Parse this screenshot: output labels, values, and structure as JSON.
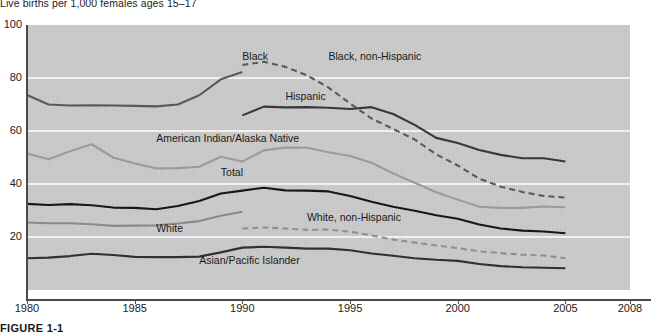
{
  "figure": {
    "subtitle": "Live births per 1,000 females ages 15–17",
    "caption": "FIGURE 1-1"
  },
  "chart_data": {
    "type": "line",
    "title": "",
    "subtitle": "Live births per 1,000 females ages 15–17",
    "xlabel": "",
    "ylabel": "Live births per 1,000 females ages 15–17",
    "xlim": [
      1980,
      2008
    ],
    "ylim": [
      0,
      100
    ],
    "xticks": [
      1980,
      1985,
      1990,
      1995,
      2000,
      2005,
      2008
    ],
    "yticks": [
      20,
      40,
      60,
      80,
      100
    ],
    "grid": "horizontal",
    "legend": "inline-labels",
    "series": [
      {
        "name": "Black",
        "style": "solid",
        "color": "#555555",
        "label_x": 1990,
        "label_y": 88,
        "x": [
          1980,
          1981,
          1982,
          1983,
          1984,
          1985,
          1986,
          1987,
          1988,
          1989,
          1990
        ],
        "values": [
          73.6,
          70.0,
          69.6,
          69.7,
          69.6,
          69.5,
          69.3,
          70.0,
          73.5,
          79.5,
          82.3
        ]
      },
      {
        "name": "Black, non-Hispanic",
        "style": "dashed",
        "color": "#555555",
        "label_x": 1994,
        "label_y": 88,
        "x": [
          1990,
          1991,
          1992,
          1993,
          1994,
          1995,
          1996,
          1997,
          1998,
          1999,
          2000,
          2001,
          2002,
          2003,
          2004,
          2005
        ],
        "values": [
          84.9,
          86.1,
          84.2,
          81.0,
          76.4,
          70.4,
          64.7,
          60.8,
          56.8,
          51.2,
          47.0,
          42.0,
          39.0,
          37.0,
          35.5,
          34.9
        ]
      },
      {
        "name": "Hispanic",
        "style": "solid",
        "color": "#333333",
        "label_x": 1992,
        "label_y": 73,
        "x": [
          1990,
          1991,
          1992,
          1993,
          1994,
          1995,
          1996,
          1997,
          1998,
          1999,
          2000,
          2001,
          2002,
          2003,
          2004,
          2005
        ],
        "values": [
          65.9,
          69.2,
          68.9,
          69.0,
          68.8,
          68.3,
          69.0,
          66.4,
          62.3,
          57.4,
          55.5,
          52.8,
          51.0,
          49.7,
          49.7,
          48.5
        ]
      },
      {
        "name": "American Indian/Alaska Native",
        "style": "solid",
        "color": "#9a9a9a",
        "label_x": 1986,
        "label_y": 57,
        "x": [
          1980,
          1981,
          1982,
          1983,
          1984,
          1985,
          1986,
          1987,
          1988,
          1989,
          1990,
          1991,
          1992,
          1993,
          1994,
          1995,
          1996,
          1997,
          1998,
          1999,
          2000,
          2001,
          2002,
          2003,
          2004,
          2005
        ],
        "values": [
          51.5,
          49.3,
          52.4,
          55.0,
          50.0,
          47.7,
          45.9,
          46.0,
          46.5,
          50.3,
          48.5,
          52.7,
          53.8,
          53.7,
          52.0,
          50.6,
          48.0,
          44.0,
          40.5,
          36.9,
          34.1,
          31.4,
          31.0,
          31.0,
          31.5,
          31.2
        ]
      },
      {
        "name": "Total",
        "style": "solid",
        "color": "#111111",
        "label_x": 1989,
        "label_y": 44,
        "x": [
          1980,
          1981,
          1982,
          1983,
          1984,
          1985,
          1986,
          1987,
          1988,
          1989,
          1990,
          1991,
          1992,
          1993,
          1994,
          1995,
          1996,
          1997,
          1998,
          1999,
          2000,
          2001,
          2002,
          2003,
          2004,
          2005
        ],
        "values": [
          32.5,
          32.1,
          32.4,
          32.0,
          31.1,
          31.0,
          30.5,
          31.7,
          33.6,
          36.4,
          37.5,
          38.6,
          37.6,
          37.5,
          37.2,
          35.5,
          33.3,
          31.4,
          29.9,
          28.2,
          26.9,
          24.7,
          23.2,
          22.4,
          22.1,
          21.4
        ]
      },
      {
        "name": "White",
        "style": "solid",
        "color": "#888888",
        "label_x": 1986,
        "label_y": 23,
        "x": [
          1980,
          1981,
          1982,
          1983,
          1984,
          1985,
          1986,
          1987,
          1988,
          1989,
          1990
        ],
        "values": [
          25.5,
          25.2,
          25.2,
          24.8,
          24.2,
          24.3,
          24.4,
          25.1,
          26.0,
          28.0,
          29.5
        ]
      },
      {
        "name": "White, non-Hispanic",
        "style": "dashed",
        "color": "#8e8e8e",
        "label_x": 1993,
        "label_y": 27,
        "x": [
          1990,
          1991,
          1992,
          1993,
          1994,
          1995,
          1996,
          1997,
          1998,
          1999,
          2000,
          2001,
          2002,
          2003,
          2004,
          2005
        ],
        "values": [
          23.2,
          23.6,
          23.2,
          22.7,
          22.8,
          22.0,
          20.6,
          19.0,
          17.9,
          16.8,
          15.8,
          14.6,
          13.9,
          13.3,
          13.0,
          12.0
        ]
      },
      {
        "name": "Asian/Pacific Islander",
        "style": "solid",
        "color": "#2b2b2b",
        "label_x": 1988,
        "label_y": 11,
        "x": [
          1980,
          1981,
          1982,
          1983,
          1984,
          1985,
          1986,
          1987,
          1988,
          1989,
          1990,
          1991,
          1992,
          1993,
          1994,
          1995,
          1996,
          1997,
          1998,
          1999,
          2000,
          2001,
          2002,
          2003,
          2004,
          2005
        ],
        "values": [
          12.0,
          12.2,
          12.8,
          13.7,
          13.2,
          12.5,
          12.4,
          12.4,
          12.6,
          14.2,
          16.0,
          16.3,
          16.0,
          15.6,
          15.6,
          15.0,
          13.8,
          12.9,
          12.0,
          11.4,
          11.0,
          9.8,
          9.0,
          8.6,
          8.4,
          8.2
        ]
      }
    ]
  }
}
